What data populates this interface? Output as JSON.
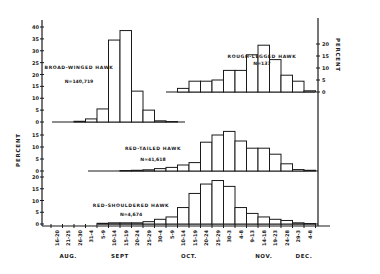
{
  "chart_data": {
    "type": "bar",
    "title": "",
    "xlabel": "",
    "ylabel": "PERCENT",
    "right_ylabel": "PERCENT",
    "categories": [
      "16-20",
      "21-25",
      "26-30",
      "31-4",
      "5-9",
      "10-14",
      "15-19",
      "20-24",
      "25-29",
      "30-4",
      "5-9",
      "10-14",
      "15-19",
      "20-24",
      "25-29",
      "30-3",
      "4-8",
      "9-13",
      "14-18",
      "19-23",
      "24-28",
      "29-3",
      "4-8"
    ],
    "month_labels": [
      {
        "label": "AUG.",
        "center_index": 1
      },
      {
        "label": "SEPT",
        "center_index": 5.5
      },
      {
        "label": "OCT.",
        "center_index": 11.5
      },
      {
        "label": "NOV.",
        "center_index": 18
      },
      {
        "label": "DEC.",
        "center_index": 21.5
      }
    ],
    "series": [
      {
        "name": "BROAD-WINGED HAWK",
        "n_label": "N=140,719",
        "axis": "left",
        "y_ticks": [
          0,
          5,
          10,
          15,
          20,
          25,
          30,
          35,
          40
        ],
        "ylim": [
          0,
          40
        ],
        "values": [
          0,
          0,
          0.3,
          1.3,
          5.5,
          34.5,
          38.5,
          13,
          5,
          0.5,
          0.2,
          0,
          0,
          0,
          0,
          0,
          0,
          0,
          0,
          0,
          0,
          0,
          0
        ]
      },
      {
        "name": "ROUGH-LEGGED HAWK",
        "n_label": "N=137",
        "axis": "right",
        "y_ticks": [
          0,
          5,
          10,
          15,
          20
        ],
        "ylim": [
          0,
          20
        ],
        "values": [
          0,
          0,
          0,
          0,
          0,
          0,
          0,
          0,
          0,
          0,
          0,
          1.5,
          4.5,
          4.5,
          5,
          9,
          9,
          15.5,
          19.5,
          13.5,
          7,
          4.5,
          0.5
        ]
      },
      {
        "name": "RED-TAILED HAWK",
        "n_label": "N=41,618",
        "axis": "left",
        "y_ticks": [
          0,
          5,
          10,
          15
        ],
        "ylim": [
          0,
          15
        ],
        "values": [
          0,
          0,
          0,
          0,
          0,
          0,
          0.2,
          0.3,
          0.5,
          1,
          1.5,
          2.5,
          3.5,
          12,
          15,
          16.5,
          12.5,
          9.5,
          9.5,
          7,
          3,
          0.6,
          0.3
        ]
      },
      {
        "name": "RED-SHOULDERED HAWK",
        "n_label": "N=4,674",
        "axis": "left",
        "y_ticks": [
          0,
          5,
          10,
          15,
          20
        ],
        "ylim": [
          0,
          20
        ],
        "values": [
          0,
          0,
          0,
          0,
          0.3,
          0.5,
          0.5,
          0.5,
          1,
          2,
          3,
          7,
          13,
          17,
          18.5,
          16,
          7,
          4.5,
          3,
          2,
          1.5,
          0.5,
          0.2
        ]
      }
    ],
    "legend_position": "inline labels",
    "grid": false
  }
}
